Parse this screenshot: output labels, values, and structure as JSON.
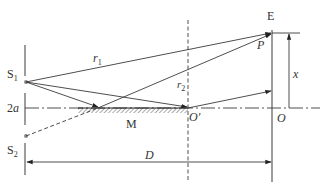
{
  "diagram": {
    "type": "Lloyd's mirror interference setup",
    "labels": {
      "screen": "E",
      "point_p": "P",
      "source_1": "S",
      "source_1_sub": "1",
      "source_2": "S",
      "source_2_sub": "2",
      "separation": "2a",
      "r1": "r",
      "r1_sub": "1",
      "r2": "r",
      "r2_sub": "2",
      "mirror": "M",
      "o_prime": "O′",
      "origin": "O",
      "x_dim": "x",
      "distance": "D"
    },
    "colors": {
      "line": "#3a3a3a",
      "dot": "#888888",
      "hatch": "#555555",
      "background": "#ffffff"
    }
  }
}
